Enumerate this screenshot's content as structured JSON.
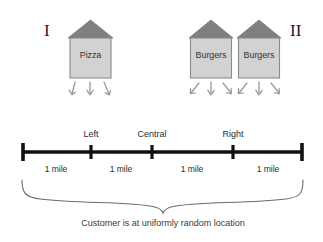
{
  "figure": {
    "panels": [
      {
        "numeral": "I",
        "x": 45,
        "y": 22
      },
      {
        "numeral": "II",
        "x": 291,
        "y": 22
      }
    ],
    "shops": [
      {
        "name": "pizza-shop",
        "label": "Pizza",
        "x": 68,
        "y": 20,
        "width": 45,
        "height": 58,
        "roof_color": "#7f7f7f",
        "body_color": "#d2d2d2",
        "border_color": "#8a8a8a",
        "arrows": 3
      },
      {
        "name": "burger-shop-left",
        "label": "Burgers",
        "x": 189,
        "y": 20,
        "width": 44,
        "height": 58,
        "roof_color": "#7f7f7f",
        "body_color": "#d2d2d2",
        "border_color": "#8a8a8a",
        "arrows": 3
      },
      {
        "name": "burger-shop-right",
        "label": "Burgers",
        "x": 237,
        "y": 20,
        "width": 44,
        "height": 58,
        "roof_color": "#7f7f7f",
        "body_color": "#d2d2d2",
        "border_color": "#8a8a8a",
        "arrows": 3
      }
    ],
    "number_line": {
      "y": 152,
      "start_x": 22,
      "end_x": 303,
      "color": "#111111",
      "ticks": [
        {
          "x": 22,
          "label": ""
        },
        {
          "x": 91,
          "label": "Left"
        },
        {
          "x": 152,
          "label": "Central"
        },
        {
          "x": 233,
          "label": "Right"
        },
        {
          "x": 303,
          "label": ""
        }
      ],
      "segments": [
        {
          "center_x": 56,
          "label": "1 mile"
        },
        {
          "center_x": 121,
          "label": "1 mile"
        },
        {
          "center_x": 192,
          "label": "1 mile"
        },
        {
          "center_x": 268,
          "label": "1 mile"
        }
      ]
    },
    "brace": {
      "left_x": 22,
      "right_x": 303,
      "top_y": 180,
      "point_x": 163,
      "point_y": 213,
      "color": "#6b6b6b"
    },
    "caption": {
      "text": "Customer is at uniformly random location",
      "x": 163,
      "y": 222
    }
  }
}
